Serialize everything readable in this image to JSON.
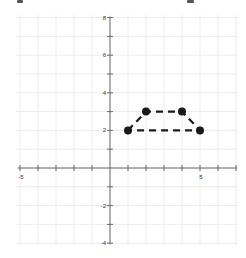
{
  "chart_data": {
    "type": "scatter",
    "title": "",
    "xlabel": "",
    "ylabel": "",
    "xlim": [
      -5,
      7
    ],
    "ylim": [
      -4,
      8
    ],
    "grid": true,
    "x_tick_labels": [
      {
        "value": -5,
        "label": "-5"
      },
      {
        "value": 5,
        "label": "5"
      }
    ],
    "y_tick_labels": [
      {
        "value": 8,
        "label": "8"
      },
      {
        "value": 6,
        "label": "6"
      },
      {
        "value": 4,
        "label": "4"
      },
      {
        "value": 2,
        "label": "2"
      },
      {
        "value": -2,
        "label": "-2"
      },
      {
        "value": -4,
        "label": "-4"
      }
    ],
    "series": [
      {
        "name": "trapezoid",
        "line_style": "dashed",
        "closed": true,
        "points": [
          {
            "x": 1,
            "y": 2
          },
          {
            "x": 2,
            "y": 3
          },
          {
            "x": 4,
            "y": 3
          },
          {
            "x": 5,
            "y": 2
          }
        ]
      }
    ]
  },
  "colors": {
    "background": "#ffffff",
    "grid": "#ececec",
    "axis": "#6b6b6b",
    "shape": "#1a1a1a",
    "label": "#333333"
  }
}
